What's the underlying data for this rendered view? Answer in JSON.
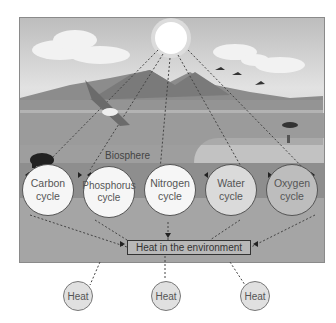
{
  "diagram": {
    "biosphere_label": "Biosphere",
    "cycles": [
      {
        "name": "Carbon",
        "line1": "Carbon",
        "line2": "cycle"
      },
      {
        "name": "Phosphorus",
        "line1": "Phosphorus",
        "line2": "cycle"
      },
      {
        "name": "Nitrogen",
        "line1": "Nitrogen",
        "line2": "cycle"
      },
      {
        "name": "Water",
        "line1": "Water",
        "line2": "cycle"
      },
      {
        "name": "Oxygen",
        "line1": "Oxygen",
        "line2": "cycle"
      }
    ],
    "heat_environment_label": "Heat in the environment",
    "heat_outputs": [
      "Heat",
      "Heat",
      "Heat"
    ],
    "scene_elements": [
      "sun-icon",
      "cloud-icon",
      "mountains",
      "hawk-icon",
      "bear-icon",
      "birds-icon",
      "lake",
      "cracked-earth"
    ]
  }
}
